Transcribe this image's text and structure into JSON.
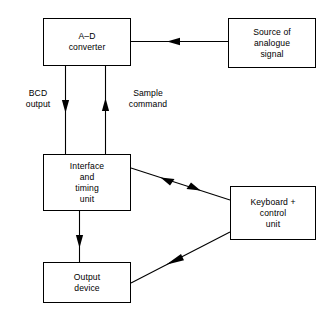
{
  "diagram": {
    "background_color": "#ffffff",
    "stroke_color": "#000000",
    "boxes": [
      {
        "id": "adc",
        "name": "a-d-converter-box",
        "lines": [
          "A–D",
          "converter"
        ]
      },
      {
        "id": "source",
        "name": "source-of-analogue-signal-box",
        "lines": [
          "Source of",
          "analogue",
          "signal"
        ]
      },
      {
        "id": "interface",
        "name": "interface-and-timing-unit-box",
        "lines": [
          "Interface",
          "and",
          "timing",
          "unit"
        ]
      },
      {
        "id": "keyboard",
        "name": "keyboard-control-unit-box",
        "lines": [
          "Keyboard +",
          "control",
          "unit"
        ]
      },
      {
        "id": "output",
        "name": "output-device-box",
        "lines": [
          "Output",
          "device"
        ]
      }
    ],
    "edge_labels": [
      {
        "id": "bcd",
        "name": "bcd-output-label",
        "lines": [
          "BCD",
          "output"
        ]
      },
      {
        "id": "sample",
        "name": "sample-command-label",
        "lines": [
          "Sample",
          "command"
        ]
      }
    ],
    "connectors": [
      {
        "id": "source-to-adc",
        "name": "connector-source-to-adc",
        "from": "source",
        "to": "adc",
        "direction": "leftward",
        "arrowheads": 1
      },
      {
        "id": "interface-to-adc",
        "name": "connector-interface-to-adc-bcd-output",
        "from": "adc",
        "to": "interface",
        "direction": "downward",
        "label": "BCD output",
        "arrowheads": 1
      },
      {
        "id": "adc-to-interface",
        "name": "connector-interface-to-adc-sample-command",
        "from": "interface",
        "to": "adc",
        "direction": "upward",
        "label": "Sample command",
        "arrowheads": 1
      },
      {
        "id": "interface-keyboard",
        "name": "connector-interface-keyboard-bidirectional",
        "from": "interface",
        "to": "keyboard",
        "direction": "bidirectional",
        "arrowheads": 2
      },
      {
        "id": "keyboard-to-output",
        "name": "connector-keyboard-to-output-device",
        "from": "keyboard",
        "to": "output",
        "direction": "down-left",
        "arrowheads": 1
      },
      {
        "id": "interface-to-output",
        "name": "connector-interface-to-output-device",
        "from": "interface",
        "to": "output",
        "direction": "downward",
        "arrowheads": 1
      }
    ]
  }
}
